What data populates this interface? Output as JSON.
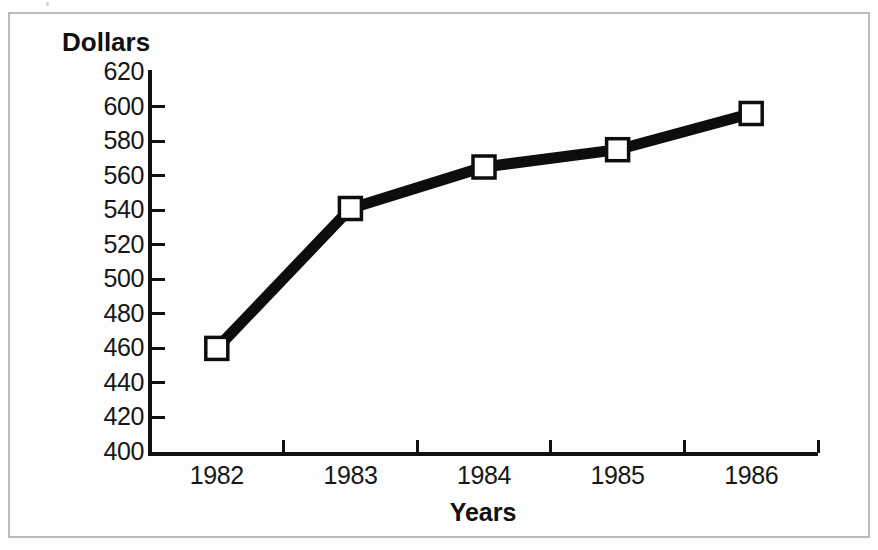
{
  "figure": {
    "background_color": "#fdfdfd",
    "frame_color": "#b9bcbe",
    "ink_color": "#111111"
  },
  "chart_data": {
    "type": "line",
    "title": "",
    "xlabel": "Years",
    "ylabel": "Dollars",
    "categories": [
      "1982",
      "1983",
      "1984",
      "1985",
      "1986"
    ],
    "values": [
      460,
      541,
      565,
      575,
      596
    ],
    "series": [
      {
        "name": "Dollars",
        "values": [
          460,
          541,
          565,
          575,
          596
        ],
        "line_color": "#0d0d0d",
        "marker": "open-square",
        "marker_fill": "#ffffff"
      }
    ],
    "ylim": [
      400,
      620
    ],
    "ytick_step": 20,
    "yticks": [
      400,
      420,
      440,
      460,
      480,
      500,
      520,
      540,
      560,
      580,
      600,
      620
    ],
    "ytick_labels": [
      "400",
      "420",
      "440",
      "460",
      "480",
      "500",
      "520",
      "540",
      "560",
      "580",
      "600",
      "620"
    ],
    "xtick_labels": [
      "1982",
      "1983",
      "1984",
      "1985",
      "1986"
    ],
    "grid": false,
    "legend": false,
    "legend_position": "none"
  }
}
